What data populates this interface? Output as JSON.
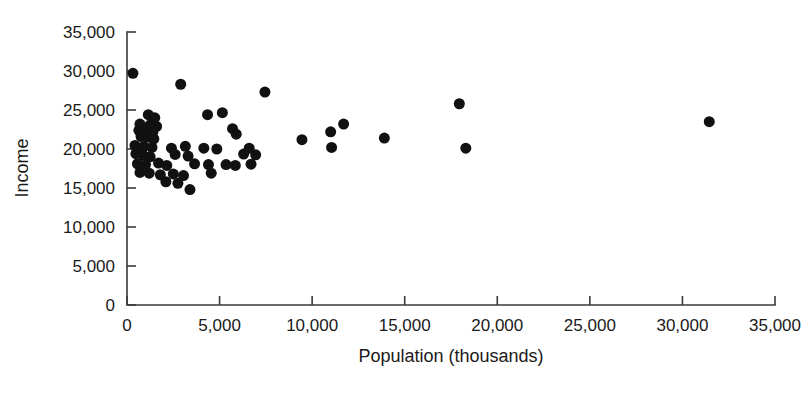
{
  "chart_data": {
    "type": "scatter",
    "title": "",
    "xlabel": "Population (thousands)",
    "ylabel": "Income",
    "xlim": [
      0,
      35000
    ],
    "ylim": [
      0,
      35000
    ],
    "grid": false,
    "legend": null,
    "marker": {
      "shape": "circle",
      "color": "#111111",
      "size_px": 11
    },
    "xticks": [
      0,
      5000,
      10000,
      15000,
      20000,
      25000,
      30000,
      35000
    ],
    "xtick_labels": [
      "0",
      "5,000",
      "10,000",
      "15,000",
      "20,000",
      "25,000",
      "30,000",
      "35,000"
    ],
    "yticks": [
      0,
      5000,
      10000,
      15000,
      20000,
      25000,
      30000,
      35000
    ],
    "ytick_labels": [
      "0",
      "5,000",
      "10,000",
      "15,000",
      "20,000",
      "25,000",
      "30,000",
      "35,000"
    ],
    "points": [
      {
        "x": 320,
        "y": 29700
      },
      {
        "x": 2900,
        "y": 28300
      },
      {
        "x": 7450,
        "y": 27300
      },
      {
        "x": 17950,
        "y": 25800
      },
      {
        "x": 31450,
        "y": 23500
      },
      {
        "x": 1150,
        "y": 24400
      },
      {
        "x": 1500,
        "y": 24000
      },
      {
        "x": 4350,
        "y": 24400
      },
      {
        "x": 5150,
        "y": 24650
      },
      {
        "x": 700,
        "y": 23200
      },
      {
        "x": 1250,
        "y": 23100
      },
      {
        "x": 1600,
        "y": 22900
      },
      {
        "x": 640,
        "y": 22400
      },
      {
        "x": 960,
        "y": 22350
      },
      {
        "x": 1400,
        "y": 22200
      },
      {
        "x": 11700,
        "y": 23200
      },
      {
        "x": 11000,
        "y": 22200
      },
      {
        "x": 5700,
        "y": 22600
      },
      {
        "x": 760,
        "y": 21600
      },
      {
        "x": 1100,
        "y": 21500
      },
      {
        "x": 1450,
        "y": 21300
      },
      {
        "x": 5900,
        "y": 21900
      },
      {
        "x": 9450,
        "y": 21200
      },
      {
        "x": 13900,
        "y": 21400
      },
      {
        "x": 430,
        "y": 20450
      },
      {
        "x": 900,
        "y": 20300
      },
      {
        "x": 1350,
        "y": 20200
      },
      {
        "x": 2400,
        "y": 20100
      },
      {
        "x": 3150,
        "y": 20350
      },
      {
        "x": 4150,
        "y": 20100
      },
      {
        "x": 4850,
        "y": 20000
      },
      {
        "x": 6600,
        "y": 20100
      },
      {
        "x": 11050,
        "y": 20200
      },
      {
        "x": 18300,
        "y": 20100
      },
      {
        "x": 480,
        "y": 19400
      },
      {
        "x": 870,
        "y": 19200
      },
      {
        "x": 1250,
        "y": 19000
      },
      {
        "x": 2600,
        "y": 19300
      },
      {
        "x": 3300,
        "y": 19100
      },
      {
        "x": 6300,
        "y": 19350
      },
      {
        "x": 6950,
        "y": 19250
      },
      {
        "x": 560,
        "y": 18100
      },
      {
        "x": 1000,
        "y": 18000
      },
      {
        "x": 1700,
        "y": 18200
      },
      {
        "x": 2150,
        "y": 17900
      },
      {
        "x": 3650,
        "y": 18100
      },
      {
        "x": 4400,
        "y": 18000
      },
      {
        "x": 5350,
        "y": 18000
      },
      {
        "x": 5850,
        "y": 17900
      },
      {
        "x": 6700,
        "y": 18050
      },
      {
        "x": 700,
        "y": 17000
      },
      {
        "x": 1200,
        "y": 16900
      },
      {
        "x": 1800,
        "y": 16700
      },
      {
        "x": 2500,
        "y": 16800
      },
      {
        "x": 3050,
        "y": 16600
      },
      {
        "x": 4550,
        "y": 16900
      },
      {
        "x": 2100,
        "y": 15800
      },
      {
        "x": 2750,
        "y": 15600
      },
      {
        "x": 3400,
        "y": 14800
      }
    ]
  },
  "geometry": {
    "plot_left": 127,
    "plot_right": 775,
    "plot_top": 32,
    "plot_bottom": 305
  }
}
